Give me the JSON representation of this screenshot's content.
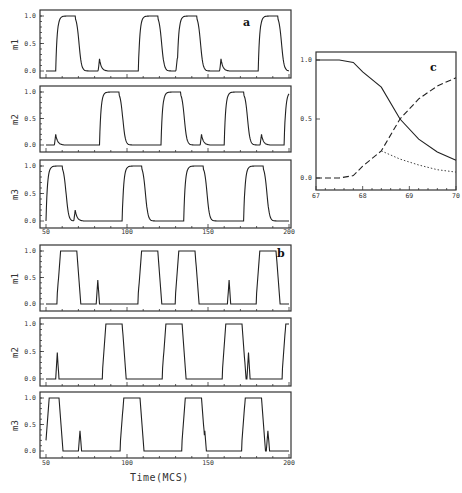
{
  "chart_data": [
    {
      "panel": "a",
      "type": "line",
      "xlabel": "",
      "xlim": [
        50,
        200
      ],
      "xticks": [
        "50",
        "100",
        "150",
        "200"
      ],
      "yticks": [
        "0.0",
        "0.5",
        "1.0"
      ],
      "ylim": [
        0,
        1
      ],
      "subplots": [
        {
          "ylabel": "m1",
          "pulses_on": [
            [
              56,
              68
            ],
            [
              107,
              119
            ],
            [
              131,
              143
            ],
            [
              181,
              193
            ]
          ],
          "spikes": [
            [
              83,
              0.22
            ],
            [
              131,
              0.22
            ],
            [
              158,
              0.22
            ]
          ],
          "note": "smooth rise/decay with small spikes (~0.2)"
        },
        {
          "ylabel": "m2",
          "pulses_on": [
            [
              83,
              95
            ],
            [
              121,
              133
            ],
            [
              160,
              172
            ],
            [
              197,
              200
            ]
          ],
          "spikes": [
            [
              56,
              0.2
            ],
            [
              94,
              0.2
            ],
            [
              146,
              0.2
            ],
            [
              183,
              0.2
            ]
          ]
        },
        {
          "ylabel": "m3",
          "pulses_on": [
            [
              50,
              60
            ],
            [
              97,
              109
            ],
            [
              135,
              147
            ],
            [
              172,
              184
            ]
          ],
          "spikes": [
            [
              68,
              0.2
            ],
            [
              108,
              0.2
            ],
            [
              148,
              0.2
            ],
            [
              186,
              0.2
            ]
          ]
        }
      ]
    },
    {
      "panel": "b",
      "type": "line",
      "xlabel": "Time(MCS)",
      "xlim": [
        50,
        200
      ],
      "xticks": [
        "50",
        "100",
        "150",
        "200"
      ],
      "yticks": [
        "0.0",
        "0.5",
        "1.0"
      ],
      "ylim": [
        0,
        1
      ],
      "subplots": [
        {
          "ylabel": "m1",
          "pulses_on": [
            [
              57,
              69
            ],
            [
              107,
              119
            ],
            [
              130,
              142
            ],
            [
              180,
              192
            ]
          ],
          "spikes": [
            [
              82,
              0.45
            ],
            [
              132,
              0.45
            ],
            [
              163,
              0.45
            ]
          ],
          "note": "trapezoidal pulses with sharp spikes (~0.45)"
        },
        {
          "ylabel": "m2",
          "pulses_on": [
            [
              85,
              97
            ],
            [
              122,
              134
            ],
            [
              159,
              171
            ],
            [
              196,
              200
            ]
          ],
          "spikes": [
            [
              57,
              0.48
            ],
            [
              94,
              0.48
            ],
            [
              135,
              0.48
            ],
            [
              175,
              0.48
            ]
          ]
        },
        {
          "ylabel": "m3",
          "pulses_on": [
            [
              50,
              58
            ],
            [
              96,
              108
            ],
            [
              134,
              146
            ],
            [
              171,
              183
            ]
          ],
          "spikes": [
            [
              71,
              0.38
            ],
            [
              109,
              0.38
            ],
            [
              148,
              0.38
            ],
            [
              187,
              0.38
            ]
          ]
        }
      ]
    },
    {
      "panel": "c",
      "type": "line",
      "xlim": [
        67,
        70
      ],
      "ylim": [
        0,
        1
      ],
      "xticks": [
        "67",
        "68",
        "69",
        "70"
      ],
      "yticks": [
        "0.0",
        "0.5",
        "1.0"
      ],
      "series": [
        {
          "name": "solid",
          "style": "solid",
          "x": [
            67,
            67.5,
            67.8,
            68.0,
            68.4,
            68.8,
            69.2,
            69.6,
            70.0
          ],
          "y": [
            1.0,
            1.0,
            0.98,
            0.9,
            0.77,
            0.5,
            0.33,
            0.22,
            0.15
          ]
        },
        {
          "name": "dashed",
          "style": "dashed",
          "x": [
            67,
            67.5,
            67.8,
            68.0,
            68.4,
            68.8,
            69.2,
            69.6,
            70.0
          ],
          "y": [
            0.0,
            0.0,
            0.02,
            0.1,
            0.23,
            0.5,
            0.67,
            0.78,
            0.85
          ]
        },
        {
          "name": "dotted",
          "style": "dotted",
          "x": [
            68.4,
            68.8,
            69.2,
            69.6,
            70.0
          ],
          "y": [
            0.23,
            0.16,
            0.11,
            0.07,
            0.05
          ]
        }
      ]
    }
  ],
  "labels": {
    "panel_a": "a",
    "panel_b": "b",
    "panel_c": "c",
    "m1": "m1",
    "m2": "m2",
    "m3": "m3",
    "x_title": "Time(MCS)"
  }
}
